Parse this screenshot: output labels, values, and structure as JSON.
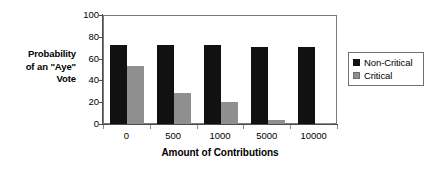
{
  "chart_data": {
    "type": "bar",
    "title": "",
    "xlabel": "Amount of Contributions",
    "ylabel": "Probability\nof an \"Aye\"\nVote",
    "ylabel_lines": [
      "Probability",
      "of an \"Aye\"",
      "Vote"
    ],
    "categories": [
      "0",
      "500",
      "1000",
      "5000",
      "10000"
    ],
    "series": [
      {
        "name": "Non-Critical",
        "color": "#111111",
        "values": [
          73,
          73,
          73,
          72,
          72
        ]
      },
      {
        "name": "Critical",
        "color": "#8f8f8f",
        "values": [
          54,
          29,
          21,
          5,
          2
        ]
      }
    ],
    "ylim": [
      0,
      100
    ],
    "yticks": [
      0,
      20,
      40,
      60,
      80,
      100
    ],
    "ytick_labels": [
      "0",
      "20",
      "40",
      "60",
      "80",
      "100"
    ],
    "grid": false,
    "legend_position": "right",
    "legend_entries": [
      "Non-Critical",
      "Critical"
    ]
  }
}
